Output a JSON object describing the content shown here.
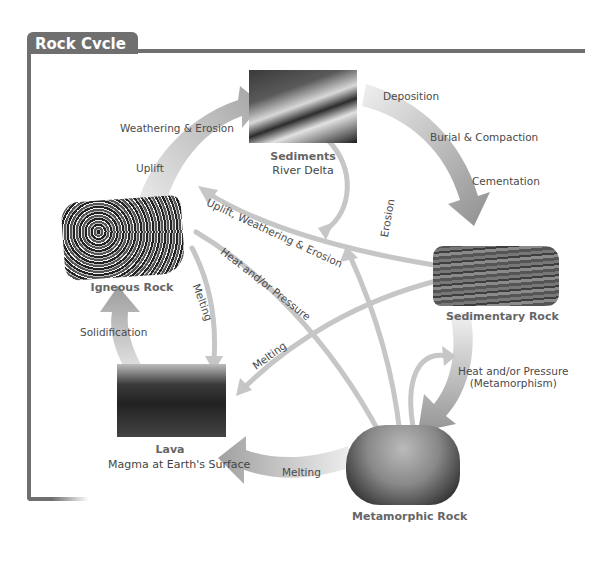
{
  "header": {
    "title": "Rock Cycle"
  },
  "nodes": {
    "sediments": {
      "title": "Sediments",
      "subtitle": "River Delta"
    },
    "sedimentary": {
      "title": "Sedimentary Rock"
    },
    "metamorphic": {
      "title": "Metamorphic Rock"
    },
    "lava": {
      "title": "Lava",
      "subtitle": "Magma at Earth's Surface"
    },
    "igneous": {
      "title": "Igneous Rock"
    }
  },
  "processes": {
    "deposition": "Deposition",
    "burial": "Burial & Compaction",
    "cementation": "Cementation",
    "heat_pressure_meta_1": "Heat and/or Pressure",
    "heat_pressure_meta_2": "(Metamorphism)",
    "melting_bottom": "Melting",
    "solidification": "Solidification",
    "uplift": "Uplift",
    "weathering_erosion": "Weathering & Erosion",
    "uplift_weathering_erosion": "Uplift, Weathering & Erosion",
    "erosion": "Erosion",
    "heat_pressure": "Heat and/or Pressure",
    "melting_igneous": "Melting",
    "melting_sedimentary": "Melting"
  },
  "colors": {
    "frame": "#6f6f6f",
    "arrow_dark": "#9a9a9a",
    "arrow_light": "#e2e2e2",
    "thin_arrow": "#c4c4c4",
    "text": "#4a4a4a",
    "title_text": "#666666"
  }
}
